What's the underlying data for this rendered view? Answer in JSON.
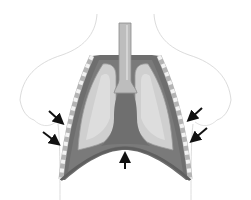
{
  "diagram": {
    "title": "Thoracic cavity - inhalation",
    "colors": {
      "background": "#ffffff",
      "body_outline": "#dcdcdc",
      "chest_wall": "#6e6e6e",
      "rib_segment": "#b4b4b4",
      "rib_gap": "#f2f2f2",
      "pleural_cavity": "#7a7a7a",
      "lung": "#cfcfcf",
      "lung_highlight": "#e3e3e3",
      "trachea": "#bdbdbd",
      "trachea_edge": "#8a8a8a",
      "mediastinum": "#6f6f6f",
      "diaphragm": "#5f5f5f",
      "arrow": "#111111"
    },
    "arrows": [
      {
        "id": "left-upper",
        "direction": "inward"
      },
      {
        "id": "left-lower",
        "direction": "inward"
      },
      {
        "id": "right-upper",
        "direction": "inward"
      },
      {
        "id": "right-lower",
        "direction": "inward"
      },
      {
        "id": "diaphragm",
        "direction": "up"
      }
    ]
  }
}
